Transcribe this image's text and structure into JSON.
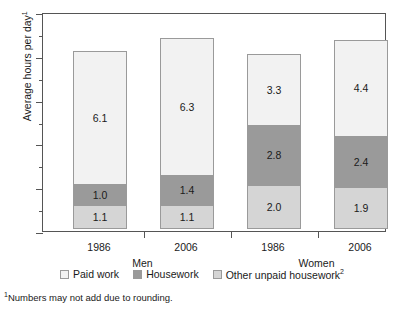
{
  "chart_data": {
    "type": "bar",
    "subtype": "stacked",
    "title": "",
    "xlabel": "",
    "ylabel": "Average hours per day",
    "ylabel_superscript": "1",
    "ylim": [
      0,
      10
    ],
    "ytick_values": [
      0,
      2,
      4,
      6,
      8,
      10
    ],
    "ytick_labels": [
      "0",
      "2",
      "4",
      "6",
      "8",
      "10"
    ],
    "yminor_values": [
      1,
      3,
      5,
      7,
      9
    ],
    "grid": false,
    "legend_position": "bottom",
    "categories": [
      "1986",
      "2006",
      "1986",
      "2006"
    ],
    "groups": [
      {
        "label": "Men",
        "categories": [
          "1986",
          "2006"
        ]
      },
      {
        "label": "Women",
        "categories": [
          "1986",
          "2006"
        ]
      }
    ],
    "series": [
      {
        "name": "Other unpaid housework",
        "superscript": "2",
        "color": "#d5d5d5",
        "values": [
          1.1,
          1.1,
          2.0,
          1.9
        ]
      },
      {
        "name": "Housework",
        "superscript": "",
        "color": "#9a9a9a",
        "values": [
          1.0,
          1.4,
          2.8,
          2.4
        ]
      },
      {
        "name": "Paid work",
        "superscript": "",
        "color": "#f2f2f2",
        "values": [
          6.1,
          6.3,
          3.3,
          4.4
        ]
      }
    ],
    "bars": [
      {
        "group": "Men",
        "category": "1986",
        "total": 8.2,
        "segments": [
          {
            "series": "Other unpaid housework",
            "value": 1.1,
            "label": "1.1"
          },
          {
            "series": "Housework",
            "value": 1.0,
            "label": "1.0"
          },
          {
            "series": "Paid work",
            "value": 6.1,
            "label": "6.1"
          }
        ]
      },
      {
        "group": "Men",
        "category": "2006",
        "total": 8.8,
        "segments": [
          {
            "series": "Other unpaid housework",
            "value": 1.1,
            "label": "1.1"
          },
          {
            "series": "Housework",
            "value": 1.4,
            "label": "1.4"
          },
          {
            "series": "Paid work",
            "value": 6.3,
            "label": "6.3"
          }
        ]
      },
      {
        "group": "Women",
        "category": "1986",
        "total": 8.1,
        "segments": [
          {
            "series": "Other unpaid housework",
            "value": 2.0,
            "label": "2.0"
          },
          {
            "series": "Housework",
            "value": 2.8,
            "label": "2.8"
          },
          {
            "series": "Paid work",
            "value": 3.3,
            "label": "3.3"
          }
        ]
      },
      {
        "group": "Women",
        "category": "2006",
        "total": 8.7,
        "segments": [
          {
            "series": "Other unpaid housework",
            "value": 1.9,
            "label": "1.9"
          },
          {
            "series": "Housework",
            "value": 2.4,
            "label": "2.4"
          },
          {
            "series": "Paid work",
            "value": 4.4,
            "label": "4.4"
          }
        ]
      }
    ],
    "legend": [
      {
        "label": "Paid work",
        "superscript": "",
        "color": "#f2f2f2"
      },
      {
        "label": "Housework",
        "superscript": "",
        "color": "#9a9a9a"
      },
      {
        "label": "Other unpaid housework",
        "superscript": "2",
        "color": "#d5d5d5"
      }
    ],
    "footnote": "Numbers may not add due to rounding.",
    "footnote_superscript": "1"
  },
  "colors": {
    "paid_work": "#f2f2f2",
    "housework": "#9a9a9a",
    "other_unpaid": "#d5d5d5",
    "axis": "#555555",
    "text": "#1a1a1a",
    "background": "#ffffff"
  }
}
